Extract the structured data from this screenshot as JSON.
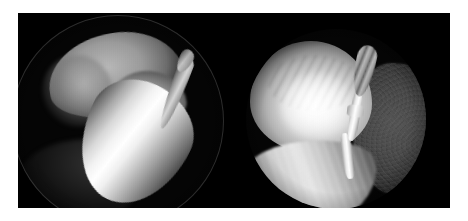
{
  "figure": {
    "kind": "endoscopic-image-pair",
    "panel_count": 2,
    "background_color": "#ffffff",
    "plate_color": "#000000",
    "caption": "",
    "labels": []
  },
  "plate": {
    "x": 18,
    "y": 13,
    "width": 432,
    "height": 195
  },
  "panels": [
    {
      "id": "left",
      "name": "left-endoscopic-view",
      "background_color": "#000000",
      "field_of_view": "circular",
      "description": "Endoscopic view showing a large rounded grayish lobe in the upper field with a brightly illuminated elongated tissue body crossing diagonally from upper-left to lower-right, and a slender tapering instrument entering from the right.",
      "structures": [
        {
          "name": "upper-lobe",
          "tone": "mid-gray",
          "position": "upper-left"
        },
        {
          "name": "main-illuminated-body",
          "tone": "bright-white-specular",
          "position": "center-diagonal"
        },
        {
          "name": "instrument-shaft",
          "tone": "light-gray",
          "position": "right"
        },
        {
          "name": "scope-rim-arc",
          "tone": "faint-gray",
          "position": "lower-left"
        }
      ]
    },
    {
      "id": "right",
      "name": "right-endoscopic-view",
      "background_color": "#000000",
      "field_of_view": "circular",
      "description": "Endoscopic view showing a bright rounded dome of tissue on the left, a bent brightly lit tubular instrument running vertically through the center with a ribbed tip, a dark grainy tissue lobe filling the right half, and a pale striated tissue sheet across the lower field.",
      "structures": [
        {
          "name": "bright-dome",
          "tone": "bright-white",
          "position": "upper-left"
        },
        {
          "name": "instrument-shaft",
          "tone": "bright-white",
          "position": "center"
        },
        {
          "name": "instrument-ribbed-tip",
          "tone": "light-gray",
          "position": "top-center"
        },
        {
          "name": "dark-lobe",
          "tone": "dark-gray-grainy",
          "position": "right"
        },
        {
          "name": "lower-tissue-sheet",
          "tone": "pale-gray-striated",
          "position": "bottom-left"
        }
      ]
    }
  ],
  "colors": {
    "background": "#ffffff",
    "plate": "#000000",
    "highlight": "#ffffff",
    "midtone": "#9b9b9b",
    "shadow": "#1a1a1a"
  }
}
